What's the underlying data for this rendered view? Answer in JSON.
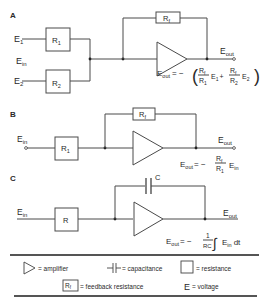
{
  "diagram": {
    "panels": [
      {
        "id": "A",
        "label": "A",
        "inputs": [
          {
            "sym": "E",
            "sub": "1"
          },
          {
            "sym": "E",
            "sub": "2"
          }
        ],
        "input_group_label": {
          "sym": "E",
          "sub": "in"
        },
        "resistors": [
          {
            "sym": "R",
            "sub": "1"
          },
          {
            "sym": "R",
            "sub": "2"
          }
        ],
        "feedback": {
          "sym": "R",
          "sub": "f"
        },
        "output": {
          "sym": "E",
          "sub": "out"
        },
        "equation": {
          "lhs_sym": "E",
          "lhs_sub": "out",
          "eq": "= −",
          "open": "(",
          "t1_num": {
            "sym": "R",
            "sub": "f"
          },
          "t1_den": {
            "sym": "R",
            "sub": "1"
          },
          "t1_var": {
            "sym": "E",
            "sub": "1"
          },
          "plus": "+",
          "t2_num": {
            "sym": "R",
            "sub": "f"
          },
          "t2_den": {
            "sym": "R",
            "sub": "2"
          },
          "t2_var": {
            "sym": "E",
            "sub": "2"
          },
          "close": ")"
        }
      },
      {
        "id": "B",
        "label": "B",
        "input": {
          "sym": "E",
          "sub": "in"
        },
        "resistor": {
          "sym": "R",
          "sub": "1"
        },
        "feedback": {
          "sym": "R",
          "sub": "f"
        },
        "output": {
          "sym": "E",
          "sub": "out"
        },
        "equation": {
          "lhs_sym": "E",
          "lhs_sub": "out",
          "eq": "= −",
          "num": {
            "sym": "R",
            "sub": "f"
          },
          "den": {
            "sym": "R",
            "sub": "1"
          },
          "var": {
            "sym": "E",
            "sub": "in"
          }
        }
      },
      {
        "id": "C",
        "label": "C",
        "input": {
          "sym": "E",
          "sub": "in"
        },
        "resistor": {
          "sym": "R"
        },
        "feedback": {
          "sym": "C"
        },
        "output": {
          "sym": "E",
          "sub": "out"
        },
        "equation": {
          "lhs_sym": "E",
          "lhs_sub": "out",
          "eq": "= −",
          "num": "1",
          "den": "RC",
          "integral": "∫",
          "var": {
            "sym": "E",
            "sub": "in"
          },
          "dt": "dt"
        }
      }
    ],
    "legend": {
      "items": [
        {
          "icon": "amplifier-icon",
          "text": "= amplifier"
        },
        {
          "icon": "capacitor-icon",
          "text": "= capacitance"
        },
        {
          "icon": "resistor-icon",
          "text": "= resistance"
        },
        {
          "icon": "feedback-resistor-icon",
          "icon_text": "Rf",
          "icon_sym": "R",
          "icon_sub": "f",
          "text": "= feedback  resistance"
        },
        {
          "icon": "voltage-icon",
          "icon_text": "E",
          "text": "= voltage"
        }
      ]
    }
  }
}
